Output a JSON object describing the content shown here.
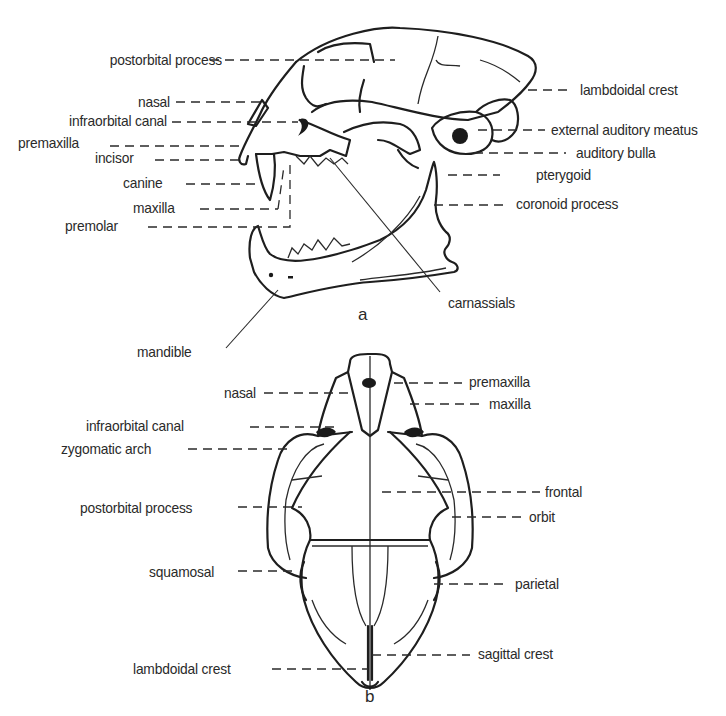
{
  "figure": {
    "panel_a": {
      "letter": "a",
      "view": "lateral skull with open jaw",
      "labels_left": [
        {
          "text": "postorbital process",
          "x": 222,
          "y": 52
        },
        {
          "text": "nasal",
          "x": 217,
          "y": 94
        },
        {
          "text": "infraorbital canal",
          "x": 197,
          "y": 113
        },
        {
          "text": "premaxilla",
          "x": 100,
          "y": 138
        },
        {
          "text": "incisor",
          "x": 145,
          "y": 154
        },
        {
          "text": "canine",
          "x": 185,
          "y": 177
        },
        {
          "text": "maxilla",
          "x": 187,
          "y": 200
        },
        {
          "text": "premolar",
          "x": 135,
          "y": 217
        }
      ],
      "labels_right": [
        {
          "text": "lambdoidal crest",
          "x": 580,
          "y": 80
        },
        {
          "text": "external auditory meatus",
          "x": 550,
          "y": 122
        },
        {
          "text": "auditory bulla",
          "x": 575,
          "y": 146
        },
        {
          "text": "pterygoid",
          "x": 535,
          "y": 168
        },
        {
          "text": "coronoid process",
          "x": 515,
          "y": 196
        }
      ],
      "label_carnassials": {
        "text": "carnassials",
        "x": 448,
        "y": 293
      },
      "label_mandible": {
        "text": "mandible",
        "x": 137,
        "y": 342
      }
    },
    "panel_b": {
      "letter": "b",
      "view": "dorsal skull",
      "labels_left": [
        {
          "text": "nasal",
          "x": 217,
          "y": 384
        },
        {
          "text": "infraorbital canal",
          "x": 86,
          "y": 417
        },
        {
          "text": "zygomatic arch",
          "x": 61,
          "y": 440
        },
        {
          "text": "postorbital process",
          "x": 80,
          "y": 500
        },
        {
          "text": "squamosal",
          "x": 149,
          "y": 564
        },
        {
          "text": "lambdoidal crest",
          "x": 133,
          "y": 660
        }
      ],
      "labels_right": [
        {
          "text": "premaxilla",
          "x": 469,
          "y": 374
        },
        {
          "text": "maxilla",
          "x": 489,
          "y": 396
        },
        {
          "text": "frontal",
          "x": 545,
          "y": 483
        },
        {
          "text": "orbit",
          "x": 529,
          "y": 509
        },
        {
          "text": "parietal",
          "x": 515,
          "y": 576
        },
        {
          "text": "sagittal crest",
          "x": 478,
          "y": 645
        }
      ]
    }
  }
}
